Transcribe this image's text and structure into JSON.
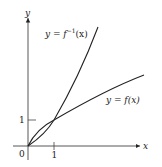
{
  "figure": {
    "axes": {
      "x_label": "x",
      "y_label": "y",
      "origin_label": "0",
      "x_tick_label": "1",
      "y_tick_label": "1"
    },
    "curves": [
      {
        "name": "inverse-function",
        "label_prefix": "y = f",
        "label_sup": "−1",
        "label_suffix": "(x)"
      },
      {
        "name": "function",
        "label": "y = f(x)"
      }
    ],
    "colors": {
      "stroke": "#222222",
      "background": "#ffffff"
    }
  }
}
